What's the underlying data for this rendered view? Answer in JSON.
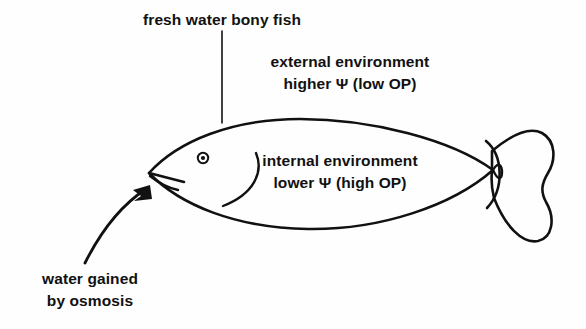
{
  "diagram": {
    "type": "biology-osmoregulation-diagram",
    "subject": "fresh water bony fish",
    "background_color": "#fefefe",
    "stroke_color": "#111111",
    "labels": {
      "title": "fresh water bony fish",
      "external": {
        "line1": "external environment",
        "line2": "higher Ψ (low OP)"
      },
      "internal": {
        "line1": "internal environment",
        "line2": "lower Ψ (high OP)"
      },
      "osmosis": {
        "line1": "water gained",
        "line2": "by osmosis"
      }
    },
    "annotations": {
      "leader_line": "vertical line from title down to fish dorsal surface",
      "arrow": "curved arrow from lower-left pointing up-right into the fish mouth",
      "arrow_direction": "into fish"
    },
    "parts": {
      "body": "fish-body-outline",
      "eye": "fish-eye",
      "mouth": "fish-mouth",
      "gill": "gill-cover-arc",
      "tail": "caudal-fin"
    }
  }
}
